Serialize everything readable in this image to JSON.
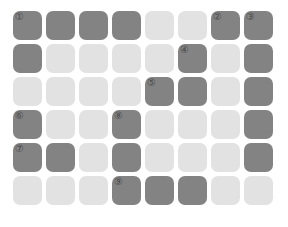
{
  "board": {
    "title": "grid-board",
    "columns": 8,
    "rows": 6,
    "colors": {
      "filled": "#838383",
      "empty": "#e2e2e2",
      "background": "#ffffff",
      "marker": "#4a4a4a"
    },
    "legend": {
      "filled_label": "filled",
      "empty_label": "empty"
    },
    "markers": [
      "①",
      "②",
      "③",
      "④",
      "⑤",
      "⑥",
      "⑦",
      "⑧",
      "⑨"
    ],
    "cells": [
      [
        {
          "state": "filled",
          "marker": "①"
        },
        {
          "state": "filled",
          "marker": ""
        },
        {
          "state": "filled",
          "marker": ""
        },
        {
          "state": "filled",
          "marker": ""
        },
        {
          "state": "empty",
          "marker": ""
        },
        {
          "state": "empty",
          "marker": ""
        },
        {
          "state": "filled",
          "marker": "②"
        },
        {
          "state": "filled",
          "marker": "③"
        }
      ],
      [
        {
          "state": "filled",
          "marker": ""
        },
        {
          "state": "empty",
          "marker": ""
        },
        {
          "state": "empty",
          "marker": ""
        },
        {
          "state": "empty",
          "marker": ""
        },
        {
          "state": "empty",
          "marker": ""
        },
        {
          "state": "filled",
          "marker": "④"
        },
        {
          "state": "empty",
          "marker": ""
        },
        {
          "state": "filled",
          "marker": ""
        }
      ],
      [
        {
          "state": "empty",
          "marker": ""
        },
        {
          "state": "empty",
          "marker": ""
        },
        {
          "state": "empty",
          "marker": ""
        },
        {
          "state": "empty",
          "marker": ""
        },
        {
          "state": "filled",
          "marker": "⑤"
        },
        {
          "state": "filled",
          "marker": ""
        },
        {
          "state": "empty",
          "marker": ""
        },
        {
          "state": "filled",
          "marker": ""
        }
      ],
      [
        {
          "state": "filled",
          "marker": "⑥"
        },
        {
          "state": "empty",
          "marker": ""
        },
        {
          "state": "empty",
          "marker": ""
        },
        {
          "state": "filled",
          "marker": "⑧"
        },
        {
          "state": "empty",
          "marker": ""
        },
        {
          "state": "empty",
          "marker": ""
        },
        {
          "state": "empty",
          "marker": ""
        },
        {
          "state": "filled",
          "marker": ""
        }
      ],
      [
        {
          "state": "filled",
          "marker": "⑦"
        },
        {
          "state": "filled",
          "marker": ""
        },
        {
          "state": "empty",
          "marker": ""
        },
        {
          "state": "filled",
          "marker": ""
        },
        {
          "state": "empty",
          "marker": ""
        },
        {
          "state": "empty",
          "marker": ""
        },
        {
          "state": "empty",
          "marker": ""
        },
        {
          "state": "filled",
          "marker": ""
        }
      ],
      [
        {
          "state": "empty",
          "marker": ""
        },
        {
          "state": "empty",
          "marker": ""
        },
        {
          "state": "empty",
          "marker": ""
        },
        {
          "state": "filled",
          "marker": "⑨"
        },
        {
          "state": "filled",
          "marker": ""
        },
        {
          "state": "filled",
          "marker": ""
        },
        {
          "state": "empty",
          "marker": ""
        },
        {
          "state": "empty",
          "marker": ""
        }
      ]
    ]
  }
}
